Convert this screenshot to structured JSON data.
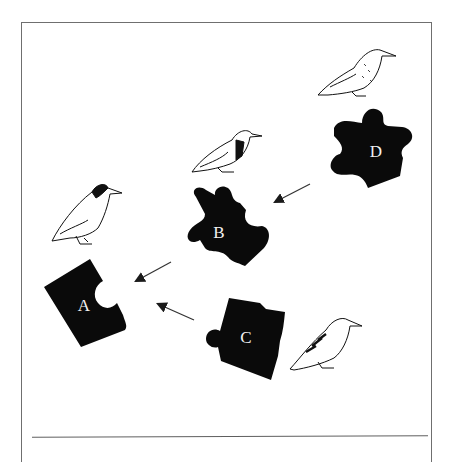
{
  "diagram": {
    "type": "puzzle-piece-sequence",
    "pieces": [
      {
        "id": "A",
        "label": "A"
      },
      {
        "id": "B",
        "label": "B"
      },
      {
        "id": "C",
        "label": "C"
      },
      {
        "id": "D",
        "label": "D"
      }
    ],
    "arrows": [
      {
        "from": "D",
        "to": "B"
      },
      {
        "from": "B",
        "to": "A"
      },
      {
        "from": "C",
        "to": "A"
      }
    ],
    "birds": [
      {
        "near": "A",
        "description": "bird with dark head"
      },
      {
        "near": "B",
        "description": "bird with dark collar"
      },
      {
        "near": "C",
        "description": "bird with barred wings"
      },
      {
        "near": "D",
        "description": "speckled bird"
      }
    ],
    "colors": {
      "piece": "#0a0a0a",
      "label": "#f2f2f2",
      "frame": "#6f6f6f",
      "arrow": "#333333"
    }
  }
}
